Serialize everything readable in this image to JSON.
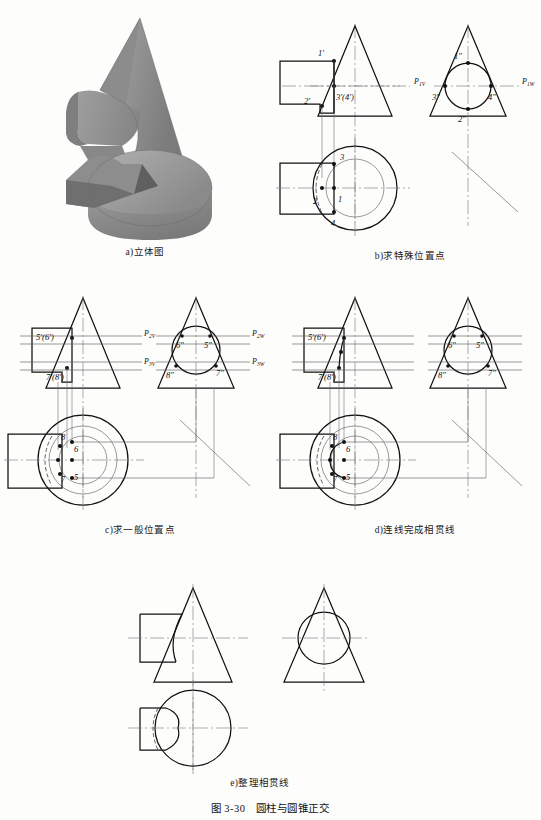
{
  "figure": {
    "number": "图 3-30",
    "title": "圆柱与圆锥正交",
    "caption_full": "图 3-30　圆柱与圆锥正交"
  },
  "panels": [
    {
      "id": "a",
      "caption": "a)立体图",
      "type": "pictorial",
      "description": "cone and cylinder shaded isometric solids"
    },
    {
      "id": "b",
      "caption": "b)求特殊位置点",
      "type": "orthographic",
      "views": [
        "front",
        "side",
        "top"
      ],
      "plane_labels": [
        {
          "text": "P",
          "sub": "1V"
        },
        {
          "text": "P",
          "sub": "1W"
        }
      ],
      "points_front": [
        "1'",
        "2'",
        "3'(4')"
      ],
      "points_side": [
        "1\"",
        "2\"",
        "3\"",
        "4\""
      ],
      "points_top": [
        "1",
        "2",
        "3",
        "4"
      ]
    },
    {
      "id": "c",
      "caption": "c)求一般位置点",
      "type": "orthographic",
      "views": [
        "front",
        "side",
        "top"
      ],
      "plane_labels": [
        {
          "text": "P",
          "sub": "2V"
        },
        {
          "text": "P",
          "sub": "3V"
        },
        {
          "text": "P",
          "sub": "2W"
        },
        {
          "text": "P",
          "sub": "3W"
        }
      ],
      "points_front": [
        "5'(6')",
        "7'(8')"
      ],
      "points_side": [
        "5\"",
        "6\"",
        "7\"",
        "8\""
      ],
      "points_top": [
        "5",
        "6",
        "7",
        "8"
      ]
    },
    {
      "id": "d",
      "caption": "d)连线完成相贯线",
      "type": "orthographic",
      "views": [
        "front",
        "side",
        "top"
      ],
      "points_front": [
        "5'(6')",
        "7'(8')"
      ],
      "points_side": [
        "5\"",
        "6\"",
        "7\"",
        "8\""
      ],
      "points_top": [
        "5",
        "6",
        "7",
        "8"
      ]
    },
    {
      "id": "e",
      "caption": "e)整理相贯线",
      "type": "orthographic",
      "views": [
        "front",
        "side",
        "top"
      ],
      "points_front": [],
      "points_side": [],
      "points_top": []
    }
  ],
  "colors": {
    "page_background": "#fdfdfc",
    "line": "#111111",
    "thin_line": "#555555",
    "center_line": "#777777",
    "solid_light": "#b4b4b4",
    "solid_mid": "#9a9a9a",
    "solid_dark": "#7e7e7e"
  }
}
